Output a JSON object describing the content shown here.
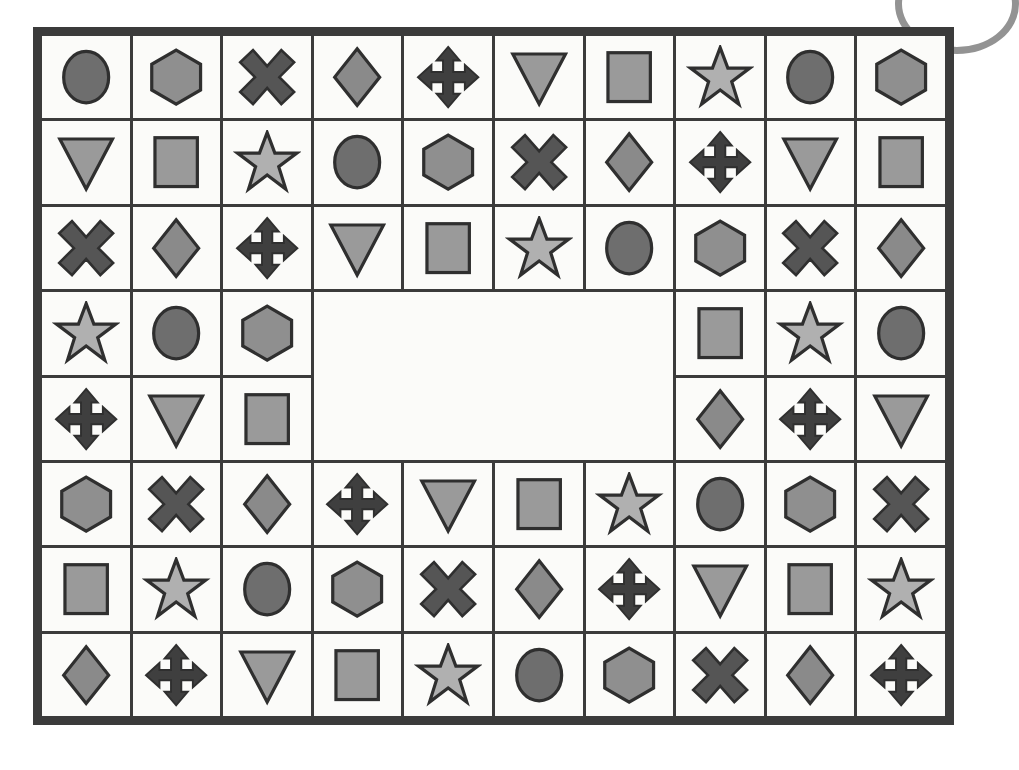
{
  "canvas": {
    "width": 985,
    "height": 770,
    "background": "#ffffff"
  },
  "decor": {
    "corner_arc": {
      "name": "partial-oval-arc",
      "color": "#8d8d8d",
      "position": "top-right-cropped"
    }
  },
  "board": {
    "name": "shape-grid",
    "columns": 10,
    "rows": 8,
    "border_color": "#3b3b3b",
    "border_width_px": 9,
    "gridline_color": "#3b3b3b",
    "gridline_width_px": 3,
    "cell_background": "#fbfbf9",
    "blank_region": {
      "start_column": 4,
      "start_row": 4,
      "column_span": 4,
      "row_span": 2,
      "fill": "#fbfbf9"
    }
  },
  "palette": {
    "circle": "#6e6e6e",
    "hexagon": "#8f8f8f",
    "cross": "#555555",
    "diamond": "#8a8a8a",
    "arrows": "#3f3f3f",
    "triangle": "#9a9a9a",
    "square": "#9a9a9a",
    "star": "#b0b0b0",
    "outline": "#2f2f2f"
  },
  "shape_cycle": [
    "circle",
    "hexagon",
    "cross",
    "diamond",
    "arrows",
    "triangle",
    "square",
    "star"
  ],
  "grid_shapes": [
    [
      "circle",
      "hexagon",
      "cross",
      "diamond",
      "arrows",
      "triangle",
      "square",
      "star",
      "circle",
      "hexagon"
    ],
    [
      "triangle",
      "square",
      "star",
      "circle",
      "hexagon",
      "cross",
      "diamond",
      "arrows",
      "triangle",
      "square"
    ],
    [
      "cross",
      "diamond",
      "arrows",
      "triangle",
      "square",
      "star",
      "circle",
      "hexagon",
      "cross",
      "diamond"
    ],
    [
      "star",
      "circle",
      "hexagon",
      "",
      "",
      "",
      "",
      "square",
      "star",
      "circle"
    ],
    [
      "arrows",
      "triangle",
      "square",
      "",
      "",
      "",
      "",
      "diamond",
      "arrows",
      "triangle"
    ],
    [
      "hexagon",
      "cross",
      "diamond",
      "arrows",
      "triangle",
      "square",
      "star",
      "circle",
      "hexagon",
      "cross"
    ],
    [
      "square",
      "star",
      "circle",
      "hexagon",
      "cross",
      "diamond",
      "arrows",
      "triangle",
      "square",
      "star"
    ],
    [
      "diamond",
      "arrows",
      "triangle",
      "square",
      "star",
      "circle",
      "hexagon",
      "cross",
      "diamond",
      "arrows"
    ]
  ]
}
